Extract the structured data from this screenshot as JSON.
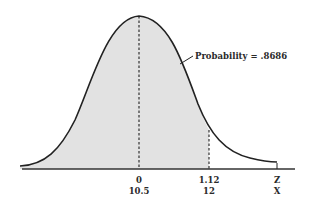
{
  "diagram": {
    "type": "normal-distribution",
    "shaded_region": "left tail up to Z = 1.12",
    "annotation": "Probability = .8686",
    "axis_rows": [
      {
        "name": "Z",
        "ticks": [
          {
            "pos": "mean",
            "label": "0"
          },
          {
            "pos": "cutoff",
            "label": "1.12"
          }
        ],
        "axis_label": "Z"
      },
      {
        "name": "X",
        "ticks": [
          {
            "pos": "mean",
            "label": "10.5"
          },
          {
            "pos": "cutoff",
            "label": "12"
          }
        ],
        "axis_label": "X"
      }
    ]
  },
  "labels": {
    "probability": "Probability = .8686",
    "z_mean": "0",
    "z_cut": "1.12",
    "z_axis": "Z",
    "x_mean": "10.5",
    "x_cut": "12",
    "x_axis": "X"
  },
  "colors": {
    "shade": "#e2e2e2",
    "curve": "#222222",
    "axis": "#333333"
  }
}
